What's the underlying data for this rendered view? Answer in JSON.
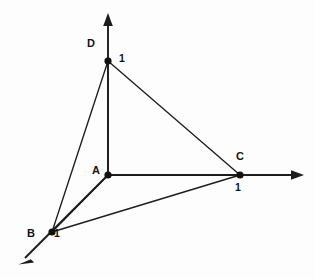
{
  "figure": {
    "background_color": "#fdfdfd",
    "ink_color": "#1d1d1d",
    "width": 315,
    "height": 279
  },
  "axes": [
    {
      "name": "vertical-axis",
      "direction": "up",
      "origin": [
        108,
        175
      ],
      "tip": [
        108,
        14
      ]
    },
    {
      "name": "horizontal-axis",
      "direction": "right",
      "origin": [
        108,
        175
      ],
      "tip": [
        303,
        175
      ]
    },
    {
      "name": "diagonal-axis",
      "direction": "down-left",
      "origin": [
        108,
        175
      ],
      "tip": [
        19,
        264
      ]
    }
  ],
  "vertices": [
    {
      "id": "A",
      "label": "A",
      "point": [
        108,
        175
      ],
      "label_pos": [
        92,
        165
      ],
      "role": "origin"
    },
    {
      "id": "D",
      "label": "D",
      "point": [
        108,
        61
      ],
      "label_pos": [
        87,
        38
      ],
      "role": "vertical-axis-unit"
    },
    {
      "id": "C",
      "label": "C",
      "point": [
        240,
        175
      ],
      "label_pos": [
        236,
        151
      ],
      "role": "horizontal-axis-unit"
    },
    {
      "id": "B",
      "label": "B",
      "point": [
        52,
        232
      ],
      "label_pos": [
        27,
        228
      ],
      "role": "diagonal-axis-unit"
    }
  ],
  "length_labels": [
    {
      "id": "len-D",
      "text": "1",
      "pos": [
        119,
        53
      ]
    },
    {
      "id": "len-C",
      "text": "1",
      "pos": [
        235,
        182
      ]
    },
    {
      "id": "len-B",
      "text": "1",
      "pos": [
        54,
        228
      ]
    }
  ],
  "edges": [
    {
      "id": "edge-A-D",
      "from": "A",
      "to": "D"
    },
    {
      "id": "edge-A-C",
      "from": "A",
      "to": "C"
    },
    {
      "id": "edge-A-B",
      "from": "A",
      "to": "B"
    },
    {
      "id": "edge-D-B",
      "from": "D",
      "to": "B"
    },
    {
      "id": "edge-D-C",
      "from": "D",
      "to": "C"
    },
    {
      "id": "edge-B-C",
      "from": "B",
      "to": "C"
    }
  ]
}
